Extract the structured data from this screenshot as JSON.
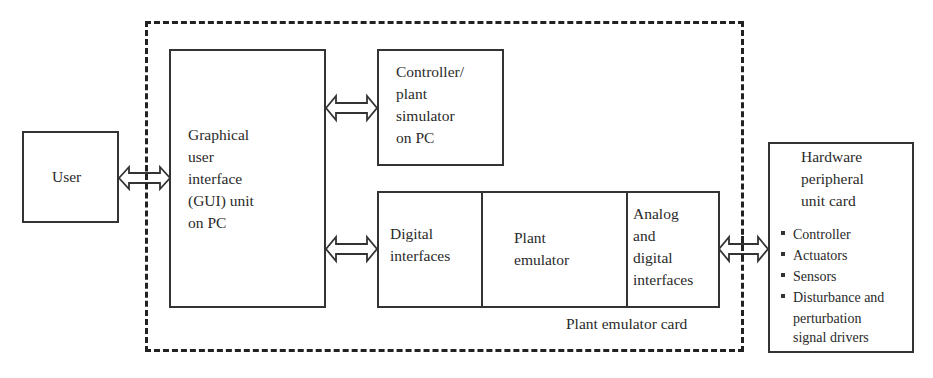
{
  "diagram": {
    "user": {
      "label": "User"
    },
    "gui_unit": {
      "lines": [
        "Graphical",
        "user",
        "interface",
        "(GUI) unit",
        "on PC"
      ]
    },
    "controller_simulator": {
      "lines": [
        "Controller/",
        "plant",
        "simulator",
        "on PC"
      ]
    },
    "plant_emulator_card": {
      "label": "Plant emulator card",
      "digital_interfaces": {
        "lines": [
          "Digital",
          "interfaces"
        ]
      },
      "plant_emulator": {
        "lines": [
          "Plant",
          "emulator"
        ]
      },
      "analog_digital_interfaces": {
        "lines": [
          "Analog",
          "and",
          "digital",
          "interfaces"
        ]
      }
    },
    "hardware_card": {
      "title_lines": [
        "Hardware",
        "peripheral",
        "unit card"
      ],
      "items": [
        "Controller",
        "Actuators",
        "Sensors",
        "Disturbance and",
        "perturbation",
        "signal drivers"
      ]
    },
    "connections": [
      {
        "from": "User",
        "to": "GUI unit",
        "type": "bidirectional"
      },
      {
        "from": "GUI unit",
        "to": "Controller/plant simulator on PC",
        "type": "bidirectional"
      },
      {
        "from": "GUI unit",
        "to": "Digital interfaces",
        "type": "bidirectional"
      },
      {
        "from": "Analog and digital interfaces",
        "to": "Hardware peripheral unit card",
        "type": "bidirectional"
      }
    ]
  }
}
